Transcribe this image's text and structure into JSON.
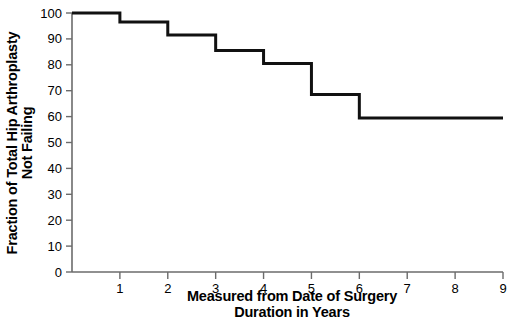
{
  "chart_data": {
    "type": "line",
    "subtype": "step",
    "title": "",
    "xlabel": "Measured from Date of Surgery\nDuration in Years",
    "xlabel_lines": [
      "Measured from Date of Surgery",
      "Duration in Years"
    ],
    "ylabel": "Fraction of Total Hip Arthroplasty\nNot Failing",
    "ylabel_lines": [
      "Fraction of Total Hip Arthroplasty",
      "Not Failing"
    ],
    "xlim": [
      0,
      9
    ],
    "ylim": [
      0,
      100
    ],
    "xticks": [
      1,
      2,
      3,
      4,
      5,
      6,
      7,
      8,
      9
    ],
    "xtick_labels": [
      "1",
      "2",
      "3",
      "4",
      "5",
      "6",
      "7",
      "8",
      "9"
    ],
    "yticks": [
      0,
      10,
      20,
      30,
      40,
      50,
      60,
      70,
      80,
      90,
      100
    ],
    "ytick_labels": [
      "0",
      "10",
      "20",
      "30",
      "40",
      "50",
      "60",
      "70",
      "80",
      "90",
      "100"
    ],
    "grid": false,
    "legend": null,
    "legend_position": "none",
    "line_color": "#111111",
    "line_width": 3,
    "axis_color": "#6b6b6b",
    "series": [
      {
        "name": "Fraction not failing",
        "step": "post",
        "x": [
          0,
          1,
          2,
          3,
          4,
          5,
          6,
          9
        ],
        "values": [
          100,
          96.5,
          91.5,
          85.5,
          80.5,
          68.5,
          59.5,
          59.5
        ]
      }
    ],
    "step_points": [
      {
        "year": 0,
        "value": 100
      },
      {
        "year": 1,
        "value": 96.5
      },
      {
        "year": 2,
        "value": 91.5
      },
      {
        "year": 3,
        "value": 85.5
      },
      {
        "year": 4,
        "value": 80.5
      },
      {
        "year": 5,
        "value": 68.5
      },
      {
        "year": 6,
        "value": 59.5
      },
      {
        "year": 9,
        "value": 59.5
      }
    ]
  }
}
